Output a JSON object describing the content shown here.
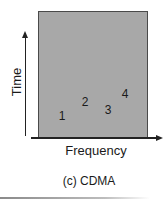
{
  "diagram": {
    "y_axis_label": "Time",
    "x_axis_label": "Frequency",
    "caption": "(c) CDMA",
    "box_fill": "#a8a8a8",
    "codes": [
      {
        "label": "1",
        "x": 62,
        "y": 116
      },
      {
        "label": "2",
        "x": 85,
        "y": 102
      },
      {
        "label": "3",
        "x": 108,
        "y": 110
      },
      {
        "label": "4",
        "x": 125,
        "y": 94
      }
    ]
  }
}
